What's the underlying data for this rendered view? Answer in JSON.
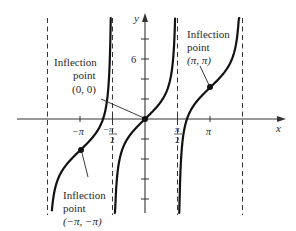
{
  "chart_data": {
    "type": "line",
    "title": "",
    "function": "y = x + tan x",
    "xlabel": "x",
    "ylabel": "y",
    "x_ticks": [
      {
        "value": -3.14159,
        "label": "−π"
      },
      {
        "value": -1.5708,
        "label": "−π/2"
      },
      {
        "value": 1.5708,
        "label": "π/2"
      },
      {
        "value": 3.14159,
        "label": "π"
      }
    ],
    "y_ticks": [
      -8,
      -6,
      -4,
      -2,
      2,
      4,
      6,
      8
    ],
    "y_tick_labels": [
      {
        "value": 6,
        "label": "6"
      }
    ],
    "asymptotes_x": [
      -4.71239,
      -1.5708,
      1.5708,
      4.71239
    ],
    "xlim": [
      -6.3,
      6.7
    ],
    "ylim": [
      -9.6,
      10.6
    ],
    "grid": false,
    "series": [
      {
        "name": "branch-1",
        "x": [
          -4.5,
          -4.2,
          -3.9,
          -3.5,
          -3.14159,
          -2.8,
          -2.4,
          -2.1,
          -1.9,
          -1.8,
          -1.7,
          -1.66,
          -1.655
        ],
        "y": [
          -9.13,
          -5.96,
          -4.85,
          -3.87,
          -3.14,
          -2.44,
          -1.48,
          -0.39,
          1.0,
          2.55,
          6.0,
          9.5,
          10.1
        ]
      },
      {
        "name": "branch-2",
        "x": [
          -1.455,
          -1.44,
          -1.4,
          -1.3,
          -1.1,
          -0.8,
          -0.4,
          0,
          0.4,
          0.8,
          1.1,
          1.3,
          1.4,
          1.44,
          1.455
        ],
        "y": [
          -10.0,
          -9.04,
          -7.2,
          -4.9,
          -3.06,
          -1.83,
          -0.82,
          0,
          0.82,
          1.83,
          3.06,
          4.9,
          7.2,
          9.04,
          10.0
        ]
      },
      {
        "name": "branch-3",
        "x": [
          1.655,
          1.66,
          1.7,
          1.8,
          1.9,
          2.1,
          2.4,
          2.8,
          3.14159,
          3.5,
          3.9,
          4.2,
          4.5,
          4.56
        ],
        "y": [
          -10.1,
          -9.5,
          -6.0,
          -2.55,
          -1.0,
          0.39,
          1.48,
          2.44,
          3.14,
          3.87,
          4.85,
          5.96,
          9.13,
          10.1
        ]
      }
    ],
    "annotations": [
      {
        "point": [
          0,
          0
        ],
        "lines": [
          "Inflection",
          "point",
          "(0, 0)"
        ]
      },
      {
        "point": [
          3.14159,
          3.14159
        ],
        "lines": [
          "Inflection",
          "point",
          "(π, π)"
        ]
      },
      {
        "point": [
          -3.14159,
          -3.14159
        ],
        "lines": [
          "Inflection",
          "point",
          "(−π, −π)"
        ]
      }
    ],
    "legend": null
  },
  "labels": {
    "x_axis": "x",
    "y_axis": "y",
    "y_tick_6": "6",
    "x_tick_neg_pi": "−π",
    "x_tick_pi": "π",
    "x_tick_neg_half_pi_num": "−π",
    "x_tick_half_pi_num": "π",
    "x_tick_half_den": "2",
    "ann_origin": {
      "l1": "Inflection",
      "l2": "point",
      "l3": "(0, 0)"
    },
    "ann_pi": {
      "l1": "Inflection",
      "l2": "point",
      "l3": "(π, π)"
    },
    "ann_neg_pi": {
      "l1": "Inflection",
      "l2": "point",
      "l3": "(−π, −π)"
    }
  }
}
